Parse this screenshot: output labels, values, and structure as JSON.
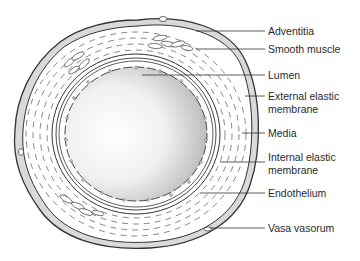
{
  "diagram": {
    "type": "cross-section",
    "labels": [
      {
        "id": "adventitia",
        "text": "Adventitia",
        "top": 25
      },
      {
        "id": "smooth-muscle",
        "text": "Smooth muscle",
        "top": 43
      },
      {
        "id": "lumen",
        "text": "Lumen",
        "top": 69
      },
      {
        "id": "external-elastic-membrane",
        "line1": "External elastic",
        "line2": "membrane",
        "top": 90
      },
      {
        "id": "media",
        "text": "Media",
        "top": 126
      },
      {
        "id": "internal-elastic-membrane",
        "line1": "Internal elastic",
        "line2": "membrane",
        "top": 151
      },
      {
        "id": "endothelium",
        "text": "Endothelium",
        "top": 187
      },
      {
        "id": "vasa-vasorum",
        "text": "Vasa vasorum",
        "top": 222
      }
    ]
  }
}
